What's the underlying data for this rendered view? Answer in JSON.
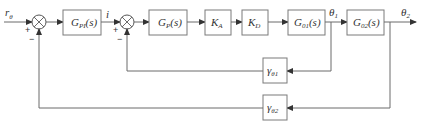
{
  "diagram": {
    "type": "block-diagram",
    "input": {
      "label": "r",
      "sub": "θ"
    },
    "signal_i": "i",
    "blocks": [
      {
        "id": "gpi",
        "label": "G",
        "sub": "PI",
        "suffix": "(s)"
      },
      {
        "id": "gp",
        "label": "G",
        "sub": "P",
        "suffix": "(s)"
      },
      {
        "id": "ka",
        "label": "K",
        "sub": "A",
        "suffix": ""
      },
      {
        "id": "kd",
        "label": "K",
        "sub": "D",
        "suffix": ""
      },
      {
        "id": "g01",
        "label": "G",
        "sub": "01",
        "suffix": "(s)"
      },
      {
        "id": "g02",
        "label": "G",
        "sub": "02",
        "suffix": "(s)"
      }
    ],
    "feedback": [
      {
        "id": "gamma1",
        "label": "γ",
        "sub": "θ1"
      },
      {
        "id": "gamma2",
        "label": "γ",
        "sub": "θ2"
      }
    ],
    "signals": {
      "theta1": {
        "label": "θ",
        "sub": "1"
      },
      "theta2": {
        "label": "θ",
        "sub": "2"
      }
    },
    "junctions": [
      {
        "id": "sum1",
        "plus": "+",
        "minus": "−"
      },
      {
        "id": "sum2",
        "plus": "+",
        "minus": "−"
      }
    ]
  }
}
